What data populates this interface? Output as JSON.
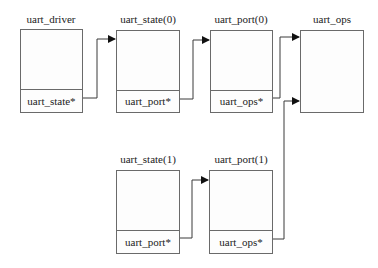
{
  "diagram": {
    "nodes": [
      {
        "id": "uart_driver",
        "title": "uart_driver",
        "field": "uart_state*"
      },
      {
        "id": "uart_state0",
        "title": "uart_state(0)",
        "field": "uart_port*"
      },
      {
        "id": "uart_port0",
        "title": "uart_port(0)",
        "field": "uart_ops*"
      },
      {
        "id": "uart_ops",
        "title": "uart_ops",
        "field": null
      },
      {
        "id": "uart_state1",
        "title": "uart_state(1)",
        "field": "uart_port*"
      },
      {
        "id": "uart_port1",
        "title": "uart_port(1)",
        "field": "uart_ops*"
      }
    ],
    "edges": [
      {
        "from": "uart_driver.uart_state*",
        "to": "uart_state0"
      },
      {
        "from": "uart_state0.uart_port*",
        "to": "uart_port0"
      },
      {
        "from": "uart_port0.uart_ops*",
        "to": "uart_ops"
      },
      {
        "from": "uart_state1.uart_port*",
        "to": "uart_port1"
      },
      {
        "from": "uart_port1.uart_ops*",
        "to": "uart_ops"
      }
    ],
    "colors": {
      "line": "#3a3a3a",
      "border": "#6a6a6a"
    }
  }
}
